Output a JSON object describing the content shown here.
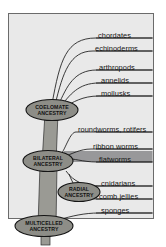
{
  "figure": {
    "kind": "phylogenetic-tree-diagram",
    "background_color": "#ffffff",
    "panel_color": "#e9e9e9",
    "panel_border_color": "#6b6b6b",
    "branch_color": "#1a1a1a",
    "trunk_fill": "#9a9a94",
    "node_fill": "#8d8d87",
    "highlight_fill": "#98989a"
  },
  "taxa": [
    {
      "id": "chordates",
      "label": "chordates",
      "y": 34,
      "label_x": 98,
      "line_y": 38,
      "highlighted": false
    },
    {
      "id": "echinoderms",
      "label": "echinoderms",
      "y": 47,
      "label_x": 95,
      "line_y": 51,
      "highlighted": false
    },
    {
      "id": "arthropods",
      "label": "arthropods",
      "y": 66,
      "label_x": 99,
      "line_y": 70,
      "highlighted": false
    },
    {
      "id": "annelids",
      "label": "annelids",
      "y": 79,
      "label_x": 101,
      "line_y": 83,
      "highlighted": false
    },
    {
      "id": "mollusks",
      "label": "mollusks",
      "y": 92,
      "label_x": 101,
      "line_y": 96,
      "highlighted": false
    },
    {
      "id": "roundworms-rotifers",
      "label": "roundworms, rotifers",
      "y": 128,
      "label_x": 78,
      "line_y": 132,
      "highlighted": false
    },
    {
      "id": "ribbon-worms",
      "label": "ribbon worms",
      "y": 145,
      "label_x": 93,
      "line_y": 149,
      "highlighted": false
    },
    {
      "id": "flatworms",
      "label": "flatworms",
      "y": 158,
      "label_x": 99,
      "line_y": 162,
      "highlighted": true
    },
    {
      "id": "cnidarians",
      "label": "cnidarians",
      "y": 182,
      "label_x": 101,
      "line_y": 186,
      "highlighted": false
    },
    {
      "id": "comb-jellies",
      "label": "comb jellies",
      "y": 195,
      "label_x": 99,
      "line_y": 199,
      "highlighted": false
    },
    {
      "id": "sponges",
      "label": "sponges",
      "y": 209,
      "label_x": 101,
      "line_y": 213,
      "highlighted": false
    }
  ],
  "ancestry_nodes": [
    {
      "id": "coelomate-ancestry",
      "line1": "COELOMATE",
      "line2": "ANCESTRY",
      "cx": 52,
      "cy": 110,
      "rx": 26,
      "ry": 10.5
    },
    {
      "id": "bilateral-ancestry",
      "line1": "BILATERAL",
      "line2": "ANCESTRY",
      "cx": 48,
      "cy": 161,
      "rx": 25,
      "ry": 10.5
    },
    {
      "id": "radial-ancestry",
      "line1": "RADIAL",
      "line2": "ANCESTRY",
      "cx": 79,
      "cy": 192,
      "rx": 21,
      "ry": 9.5
    },
    {
      "id": "multicelled-ancestry",
      "line1": "MULTICELLED",
      "line2": "ANCESTRY",
      "cx": 44,
      "cy": 226,
      "rx": 29,
      "ry": 10.5
    }
  ],
  "panel": {
    "x": 8,
    "y": 13,
    "width": 146,
    "height": 206
  }
}
